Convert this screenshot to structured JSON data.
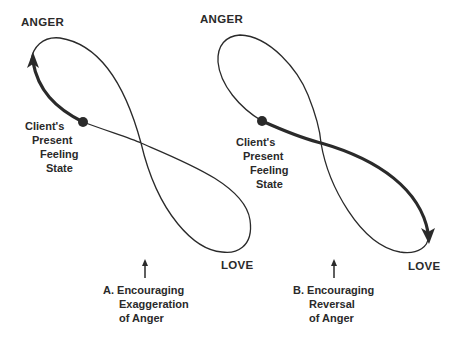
{
  "figures": [
    {
      "id": "A",
      "top_pole": "ANGER",
      "bottom_pole": "LOVE",
      "state_label": [
        "Client's",
        "Present",
        "Feeling",
        "State"
      ],
      "caption": [
        "A. Encouraging",
        "Exaggeration",
        "of Anger"
      ],
      "direction": "toward anger (exaggeration)"
    },
    {
      "id": "B",
      "top_pole": "ANGER",
      "bottom_pole": "LOVE",
      "state_label": [
        "Client's",
        "Present",
        "Feeling",
        "State"
      ],
      "caption": [
        "B. Encouraging",
        "Reversal",
        "of Anger"
      ],
      "direction": "toward love (reversal)"
    }
  ],
  "colors": {
    "line": "#2a2a2a",
    "background": "#ffffff"
  }
}
